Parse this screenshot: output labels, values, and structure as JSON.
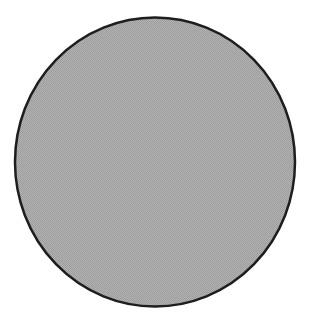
{
  "figure": {
    "shape": "circle",
    "center": {
      "x": 155,
      "y": 162
    },
    "radius_x": 140,
    "radius_y": 144.5,
    "fill_color": "#b3b3b3",
    "fill_dither_color": "#9c9c9c",
    "stroke_color": "#1e1e1e",
    "stroke_width": 2.5
  }
}
